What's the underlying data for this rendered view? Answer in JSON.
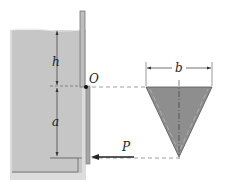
{
  "diagram": {
    "labels": {
      "h": "h",
      "a": "a",
      "O": "O",
      "P": "P",
      "b": "b"
    },
    "colors": {
      "water": "#c9c9c9",
      "water_light": "#d8d8d8",
      "gate": "#b8b8b8",
      "tank_wall": "#a8a8a8",
      "triangle_fill": "#8f8f8f",
      "line": "#333333",
      "dashed": "#888888"
    },
    "elements": [
      "water tank with free surface",
      "vertical gate hinged at O",
      "dimension h from surface to O",
      "dimension a from O to bottom of gate",
      "force P applied horizontally at gate bottom",
      "triangular gate cross-section of width b"
    ]
  }
}
